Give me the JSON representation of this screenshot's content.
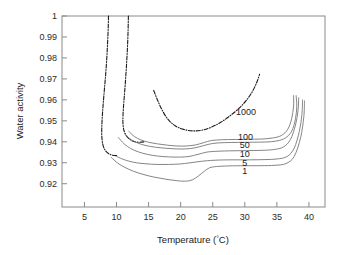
{
  "chart_data": {
    "type": "line",
    "title": "",
    "xlabel": "Temperature (°C)",
    "ylabel": "Water activity",
    "xlim": [
      1.5,
      42.5
    ],
    "ylim": [
      0.9089,
      1.0
    ],
    "grid": false,
    "legend_position": "inline-curve-labels",
    "xticks": [
      5,
      10,
      15,
      20,
      25,
      30,
      35,
      40
    ],
    "xtick_labels": [
      "5",
      "10",
      "15",
      "20",
      "25",
      "30",
      "35",
      "40"
    ],
    "yticks": [
      0.92,
      0.93,
      0.94,
      0.95,
      0.96,
      0.97,
      0.98,
      0.99,
      1
    ],
    "ytick_labels": [
      "0.92",
      "0.93",
      "0.94",
      "0.95",
      "0.96",
      "0.97",
      "0.98",
      "0.99",
      "1"
    ],
    "series": [
      {
        "name": "1000",
        "label": "1000",
        "style": "dash-dot",
        "color": "#1a1a1a",
        "label_x": 30.2,
        "label_y": 0.9545,
        "points": [
          [
            15.8,
            0.9645
          ],
          [
            16.4,
            0.9598
          ],
          [
            17.1,
            0.9552
          ],
          [
            18.0,
            0.9508
          ],
          [
            19.2,
            0.9475
          ],
          [
            20.6,
            0.9458
          ],
          [
            22.0,
            0.9452
          ],
          [
            23.4,
            0.9456
          ],
          [
            24.8,
            0.947
          ],
          [
            26.2,
            0.9492
          ],
          [
            27.6,
            0.9522
          ],
          [
            29.0,
            0.9557
          ],
          [
            30.2,
            0.9596
          ],
          [
            31.2,
            0.9641
          ],
          [
            31.9,
            0.9686
          ],
          [
            32.3,
            0.9722
          ]
        ]
      },
      {
        "name": "dashdot-left-outer",
        "label": "",
        "style": "dash-dot",
        "color": "#1a1a1a",
        "points": [
          [
            8.75,
            1.0
          ],
          [
            8.7,
            0.994
          ],
          [
            8.62,
            0.988
          ],
          [
            8.52,
            0.982
          ],
          [
            8.4,
            0.976
          ],
          [
            8.25,
            0.97
          ],
          [
            8.08,
            0.964
          ],
          [
            7.92,
            0.958
          ],
          [
            7.78,
            0.952
          ],
          [
            7.7,
            0.9465
          ],
          [
            7.72,
            0.942
          ],
          [
            7.88,
            0.9385
          ],
          [
            8.22,
            0.936
          ],
          [
            8.75,
            0.9344
          ],
          [
            9.4,
            0.9336
          ],
          [
            10.1,
            0.9334
          ]
        ]
      },
      {
        "name": "dashdot-left-inner",
        "label": "",
        "style": "dash-dot",
        "color": "#1a1a1a",
        "points": [
          [
            11.85,
            1.0
          ],
          [
            11.8,
            0.993
          ],
          [
            11.72,
            0.986
          ],
          [
            11.6,
            0.979
          ],
          [
            11.46,
            0.972
          ],
          [
            11.3,
            0.965
          ],
          [
            11.14,
            0.959
          ],
          [
            11.02,
            0.9535
          ],
          [
            11.0,
            0.949
          ],
          [
            11.15,
            0.9455
          ],
          [
            11.55,
            0.9428
          ],
          [
            12.15,
            0.941
          ],
          [
            12.9,
            0.94
          ],
          [
            13.65,
            0.9398
          ],
          [
            14.35,
            0.94
          ]
        ]
      },
      {
        "name": "100",
        "label": "100",
        "style": "solid",
        "color": "#777777",
        "label_x": 30.1,
        "label_y": 0.9424,
        "points": [
          [
            11.9,
            0.945
          ],
          [
            12.8,
            0.9425
          ],
          [
            13.8,
            0.9409
          ],
          [
            15.0,
            0.9398
          ],
          [
            16.4,
            0.939
          ],
          [
            17.9,
            0.9384
          ],
          [
            19.4,
            0.938
          ],
          [
            20.9,
            0.938
          ],
          [
            22.3,
            0.9385
          ],
          [
            23.6,
            0.9396
          ],
          [
            24.8,
            0.9406
          ],
          [
            26.5,
            0.941
          ],
          [
            28.5,
            0.9411
          ],
          [
            30.5,
            0.9412
          ],
          [
            32.5,
            0.9413
          ],
          [
            34.3,
            0.9418
          ],
          [
            35.7,
            0.943
          ],
          [
            36.7,
            0.946
          ],
          [
            37.3,
            0.951
          ],
          [
            37.6,
            0.957
          ],
          [
            37.6,
            0.962
          ]
        ]
      },
      {
        "name": "50",
        "label": "50",
        "style": "solid",
        "color": "#777777",
        "label_x": 30.0,
        "label_y": 0.9386,
        "points": [
          [
            11.2,
            0.944
          ],
          [
            12.2,
            0.9412
          ],
          [
            13.3,
            0.9394
          ],
          [
            14.6,
            0.9382
          ],
          [
            16.1,
            0.9374
          ],
          [
            17.7,
            0.9369
          ],
          [
            19.3,
            0.9366
          ],
          [
            20.8,
            0.9366
          ],
          [
            22.2,
            0.9371
          ],
          [
            23.6,
            0.9382
          ],
          [
            25.0,
            0.9392
          ],
          [
            26.8,
            0.9396
          ],
          [
            29.0,
            0.9397
          ],
          [
            31.2,
            0.9398
          ],
          [
            33.3,
            0.9399
          ],
          [
            35.0,
            0.9404
          ],
          [
            36.3,
            0.9418
          ],
          [
            37.3,
            0.945
          ],
          [
            37.9,
            0.951
          ],
          [
            38.1,
            0.957
          ],
          [
            38.0,
            0.962
          ]
        ]
      },
      {
        "name": "10",
        "label": "10",
        "style": "solid",
        "color": "#777777",
        "label_x": 30.0,
        "label_y": 0.9342,
        "points": [
          [
            10.3,
            0.942
          ],
          [
            11.2,
            0.939
          ],
          [
            12.2,
            0.9368
          ],
          [
            13.4,
            0.9352
          ],
          [
            14.8,
            0.934
          ],
          [
            16.4,
            0.9332
          ],
          [
            18.1,
            0.9328
          ],
          [
            19.8,
            0.9327
          ],
          [
            21.3,
            0.933
          ],
          [
            22.7,
            0.934
          ],
          [
            24.1,
            0.9351
          ],
          [
            25.8,
            0.9355
          ],
          [
            28.0,
            0.9357
          ],
          [
            30.3,
            0.9358
          ],
          [
            32.5,
            0.9359
          ],
          [
            34.5,
            0.9363
          ],
          [
            36.0,
            0.9375
          ],
          [
            37.1,
            0.941
          ],
          [
            37.9,
            0.948
          ],
          [
            38.3,
            0.955
          ],
          [
            38.4,
            0.961
          ]
        ]
      },
      {
        "name": "5",
        "label": "5",
        "style": "solid",
        "color": "#777777",
        "label_x": 30.0,
        "label_y": 0.9302,
        "points": [
          [
            10.05,
            0.933
          ],
          [
            10.9,
            0.9318
          ],
          [
            11.9,
            0.9308
          ],
          [
            13.1,
            0.93
          ],
          [
            14.6,
            0.9295
          ],
          [
            16.3,
            0.9292
          ],
          [
            18.1,
            0.9292
          ],
          [
            19.8,
            0.9294
          ],
          [
            21.3,
            0.9299
          ],
          [
            22.7,
            0.9305
          ],
          [
            24.2,
            0.931
          ],
          [
            26.0,
            0.9313
          ],
          [
            28.3,
            0.9314
          ],
          [
            30.7,
            0.9314
          ],
          [
            33.0,
            0.9315
          ],
          [
            35.0,
            0.9318
          ],
          [
            36.6,
            0.933
          ],
          [
            37.7,
            0.937
          ],
          [
            38.5,
            0.945
          ],
          [
            38.9,
            0.953
          ],
          [
            39.0,
            0.96
          ]
        ]
      },
      {
        "name": "1",
        "label": "1",
        "style": "solid",
        "color": "#777777",
        "label_x": 30.0,
        "label_y": 0.9262,
        "points": [
          [
            9.2,
            0.9325
          ],
          [
            10.2,
            0.9298
          ],
          [
            11.3,
            0.9278
          ],
          [
            12.6,
            0.926
          ],
          [
            14.1,
            0.9245
          ],
          [
            15.8,
            0.9232
          ],
          [
            17.6,
            0.9222
          ],
          [
            19.3,
            0.9215
          ],
          [
            20.6,
            0.9212
          ],
          [
            21.8,
            0.9218
          ],
          [
            22.8,
            0.9238
          ],
          [
            23.7,
            0.926
          ],
          [
            24.5,
            0.9276
          ],
          [
            25.6,
            0.9282
          ],
          [
            27.5,
            0.9285
          ],
          [
            30.0,
            0.9286
          ],
          [
            32.5,
            0.9286
          ],
          [
            34.7,
            0.9288
          ],
          [
            36.4,
            0.9296
          ],
          [
            37.7,
            0.933
          ],
          [
            38.7,
            0.942
          ],
          [
            39.2,
            0.952
          ],
          [
            39.3,
            0.9595
          ]
        ]
      }
    ]
  },
  "axes": {
    "frame_color": "#7a7a7a"
  }
}
